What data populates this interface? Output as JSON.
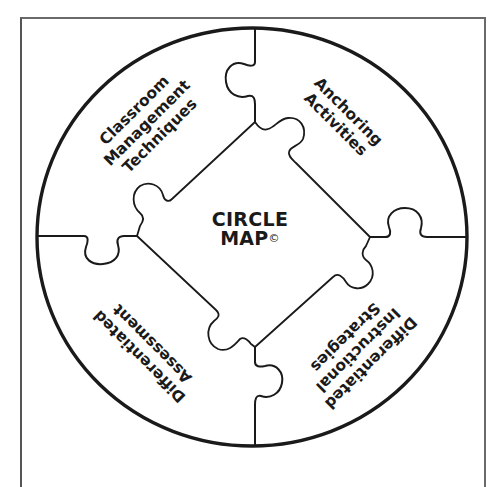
{
  "diagram": {
    "title_line1": "CIRCLE",
    "title_line2": "MAP",
    "title_mark": "©",
    "stroke_color": "#1a1a1a",
    "frame_color": "#6a6a6a",
    "background": "#ffffff",
    "segments": [
      {
        "position": "top-left",
        "lines": [
          "Classroom",
          "Management",
          "Techniques"
        ]
      },
      {
        "position": "top-right",
        "lines": [
          "Anchoring",
          "Activities"
        ]
      },
      {
        "position": "bottom-left",
        "lines": [
          "Differentiated",
          "Assessment"
        ]
      },
      {
        "position": "bottom-right",
        "lines": [
          "Differentiated",
          "Instructional",
          "Strategies"
        ]
      }
    ]
  }
}
